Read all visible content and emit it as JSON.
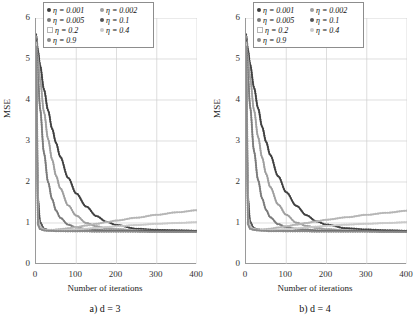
{
  "figure": {
    "panels": [
      {
        "id": "panel-a",
        "caption": "a)  d = 3",
        "xlabel": "Number of iterations",
        "ylabel": "MSE",
        "legend_title": ""
      },
      {
        "id": "panel-b",
        "caption": "b)  d = 4",
        "xlabel": "Number of iterations",
        "ylabel": "MSE",
        "legend_title": ""
      }
    ]
  },
  "axes": {
    "yticks": [
      "0",
      "1",
      "2",
      "3",
      "4",
      "5",
      "6"
    ],
    "xticks": [
      "0",
      "100",
      "200",
      "300",
      "400"
    ]
  },
  "legend": {
    "items": [
      {
        "label": "η = 0.001",
        "color": "#3f3f3f",
        "marker": "dot"
      },
      {
        "label": "η = 0.002",
        "color": "#9e9e9e",
        "marker": "dot"
      },
      {
        "label": "η = 0.005",
        "color": "#7a7a7a",
        "marker": "dot"
      },
      {
        "label": "η = 0.1",
        "color": "#555555",
        "marker": "dot"
      },
      {
        "label": "η = 0.2",
        "color": "#b5b5b5",
        "marker": "sq"
      },
      {
        "label": "η = 0.4",
        "color": "#c9c9c9",
        "marker": "dot"
      },
      {
        "label": "η = 0.9",
        "color": "#8a8a8a",
        "marker": "dot"
      }
    ]
  },
  "chart_data": {
    "type": "line",
    "title": "",
    "xlabel": "Number of iterations",
    "ylabel": "MSE",
    "xlim": [
      0,
      400
    ],
    "ylim": [
      0,
      6
    ],
    "xticks": [
      0,
      100,
      200,
      300,
      400
    ],
    "yticks": [
      0,
      1,
      2,
      3,
      4,
      5,
      6
    ],
    "grid": true,
    "legend_position": "top-center",
    "panels": [
      {
        "name": "a) d = 3",
        "x": [
          0,
          5,
          10,
          20,
          30,
          40,
          50,
          60,
          80,
          100,
          125,
          150,
          175,
          200,
          250,
          300,
          350,
          400
        ],
        "series": [
          {
            "name": "η = 0.001",
            "color": "#3f3f3f",
            "values": [
              5.6,
              5.2,
              4.85,
              4.25,
              3.75,
              3.3,
              2.95,
              2.62,
              2.1,
              1.72,
              1.4,
              1.17,
              1.03,
              0.95,
              0.86,
              0.83,
              0.82,
              0.81
            ]
          },
          {
            "name": "η = 0.002",
            "color": "#9e9e9e",
            "values": [
              5.55,
              5.0,
              4.5,
              3.7,
              3.05,
              2.55,
              2.15,
              1.85,
              1.43,
              1.18,
              1.0,
              0.92,
              0.87,
              0.85,
              0.82,
              0.81,
              0.8,
              0.8
            ]
          },
          {
            "name": "η = 0.005",
            "color": "#7a7a7a",
            "values": [
              5.5,
              4.55,
              3.8,
              2.7,
              2.0,
              1.58,
              1.3,
              1.13,
              0.96,
              0.89,
              0.85,
              0.83,
              0.82,
              0.81,
              0.8,
              0.8,
              0.79,
              0.79
            ]
          },
          {
            "name": "η = 0.1",
            "color": "#555555",
            "values": [
              5.45,
              1.6,
              1.02,
              0.86,
              0.83,
              0.82,
              0.81,
              0.81,
              0.8,
              0.8,
              0.8,
              0.8,
              0.8,
              0.8,
              0.8,
              0.8,
              0.8,
              0.8
            ]
          },
          {
            "name": "η = 0.2",
            "color": "#b5b5b5",
            "values": [
              5.4,
              1.12,
              0.9,
              0.84,
              0.83,
              0.83,
              0.84,
              0.85,
              0.87,
              0.9,
              0.94,
              0.98,
              1.02,
              1.06,
              1.13,
              1.2,
              1.26,
              1.31
            ]
          },
          {
            "name": "η = 0.4",
            "color": "#c9c9c9",
            "values": [
              5.35,
              1.0,
              0.87,
              0.83,
              0.82,
              0.82,
              0.82,
              0.82,
              0.83,
              0.84,
              0.86,
              0.88,
              0.9,
              0.92,
              0.95,
              0.98,
              1.0,
              1.02
            ]
          },
          {
            "name": "η = 0.9",
            "color": "#8a8a8a",
            "values": [
              5.3,
              0.95,
              0.85,
              0.82,
              0.81,
              0.81,
              0.8,
              0.8,
              0.8,
              0.8,
              0.8,
              0.79,
              0.79,
              0.79,
              0.79,
              0.78,
              0.78,
              0.78
            ]
          }
        ]
      },
      {
        "name": "b) d = 4",
        "x": [
          0,
          5,
          10,
          20,
          30,
          40,
          50,
          60,
          80,
          100,
          125,
          150,
          175,
          200,
          250,
          300,
          350,
          400
        ],
        "series": [
          {
            "name": "η = 0.001",
            "color": "#3f3f3f",
            "values": [
              5.6,
              5.22,
              4.88,
              4.3,
              3.8,
              3.35,
              2.98,
              2.66,
              2.14,
              1.75,
              1.42,
              1.19,
              1.04,
              0.96,
              0.87,
              0.84,
              0.82,
              0.81
            ]
          },
          {
            "name": "η = 0.002",
            "color": "#9e9e9e",
            "values": [
              5.55,
              5.02,
              4.55,
              3.75,
              3.1,
              2.6,
              2.2,
              1.88,
              1.45,
              1.2,
              1.01,
              0.93,
              0.88,
              0.85,
              0.82,
              0.81,
              0.81,
              0.8
            ]
          },
          {
            "name": "η = 0.005",
            "color": "#7a7a7a",
            "values": [
              5.5,
              4.6,
              3.85,
              2.75,
              2.05,
              1.6,
              1.32,
              1.14,
              0.97,
              0.9,
              0.86,
              0.84,
              0.82,
              0.81,
              0.8,
              0.8,
              0.8,
              0.79
            ]
          },
          {
            "name": "η = 0.1",
            "color": "#555555",
            "values": [
              5.45,
              1.62,
              1.03,
              0.87,
              0.84,
              0.83,
              0.82,
              0.81,
              0.81,
              0.8,
              0.8,
              0.8,
              0.8,
              0.8,
              0.8,
              0.8,
              0.8,
              0.8
            ]
          },
          {
            "name": "η = 0.2",
            "color": "#b5b5b5",
            "values": [
              5.4,
              1.14,
              0.91,
              0.85,
              0.84,
              0.84,
              0.85,
              0.86,
              0.89,
              0.92,
              0.96,
              1.0,
              1.04,
              1.08,
              1.14,
              1.2,
              1.25,
              1.3
            ]
          },
          {
            "name": "η = 0.4",
            "color": "#c9c9c9",
            "values": [
              5.35,
              1.02,
              0.88,
              0.84,
              0.83,
              0.83,
              0.83,
              0.83,
              0.84,
              0.85,
              0.87,
              0.89,
              0.91,
              0.93,
              0.96,
              0.98,
              1.0,
              1.02
            ]
          },
          {
            "name": "η = 0.9",
            "color": "#8a8a8a",
            "values": [
              5.3,
              0.96,
              0.86,
              0.83,
              0.82,
              0.81,
              0.81,
              0.8,
              0.8,
              0.8,
              0.8,
              0.8,
              0.79,
              0.79,
              0.79,
              0.79,
              0.78,
              0.78
            ]
          }
        ]
      }
    ]
  }
}
